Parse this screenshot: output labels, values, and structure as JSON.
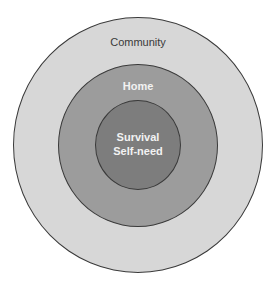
{
  "diagram": {
    "type": "concentric-circles",
    "rings": [
      {
        "name": "outer",
        "label": "Community",
        "color": "#d7d7d7"
      },
      {
        "name": "middle",
        "label": "Home",
        "color": "#9c9c9c"
      },
      {
        "name": "inner",
        "label_line1": "Survival",
        "label_line2": "Self-need",
        "color": "#7d7d7d"
      }
    ]
  }
}
